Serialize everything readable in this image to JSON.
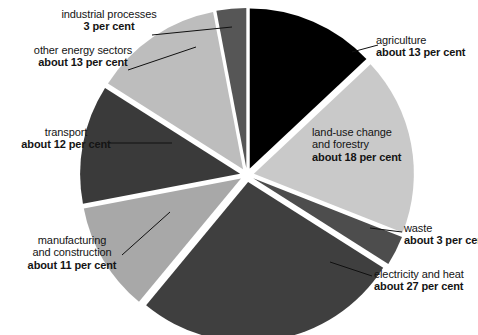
{
  "chart_data": {
    "type": "pie",
    "title": "Worldwide GHG Emissions",
    "xlabel": "",
    "ylabel": "",
    "legend_position": "callout-labels",
    "grid": false,
    "explode": true,
    "center": [
      247,
      175
    ],
    "radius": 160,
    "categories": [
      "agriculture",
      "land-use change and forestry",
      "waste",
      "electricity and heat",
      "manufacturing and construction",
      "transport",
      "other energy sectors",
      "industrial processes"
    ],
    "values": [
      13,
      18,
      3,
      27,
      11,
      12,
      13,
      3
    ],
    "value_labels": [
      "about 13 per cent",
      "about 18 per cent",
      "about 3 per cent",
      "about 27 per cent",
      "about 11 per cent",
      "about 12 per cent",
      "about 13 per cent",
      "3 per cent"
    ],
    "colors": [
      "#000000",
      "#c9c9c9",
      "#4d4d4d",
      "#3f3f3f",
      "#a8a8a8",
      "#3a3a3a",
      "#bdbdbd",
      "#565656"
    ]
  },
  "slices": {
    "agriculture": {
      "name": "agriculture",
      "value": "about 13 per cent"
    },
    "landuse": {
      "name_line1": "land-use change",
      "name_line2": "and forestry",
      "value": "about 18 per cent"
    },
    "waste": {
      "name": "waste",
      "value": "about 3 per cent"
    },
    "electricity": {
      "name": "electricity and heat",
      "value": "about 27 per cent"
    },
    "manufacturing": {
      "name_line1": "manufacturing",
      "name_line2": "and construction",
      "value": "about 11 per cent"
    },
    "transport": {
      "name": "transport",
      "value": "about 12 per cent"
    },
    "other_energy": {
      "name": "other energy sectors",
      "value": "about 13 per cent"
    },
    "industrial": {
      "name": "industrial processes",
      "value": "3 per cent"
    }
  },
  "colors": {
    "background": "#ffffff",
    "text": "#141414",
    "leader_line": "#101010"
  }
}
